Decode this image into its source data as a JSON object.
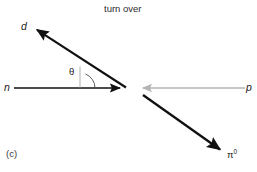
{
  "figure": {
    "title": "turn over",
    "part_label": "(c)",
    "background_color": "#ffffff"
  },
  "diagram": {
    "vertex": {
      "x": 126,
      "y": 88
    },
    "angle_marker": {
      "symbol": "θ",
      "name": "theta",
      "color": "#1a1a1a"
    },
    "arrows": [
      {
        "name": "deuteron-arrow",
        "label": "d",
        "italic": true,
        "color": "#111111",
        "from": {
          "x": 126,
          "y": 88
        },
        "to": {
          "x": 33,
          "y": 27
        },
        "width": 2.1,
        "head": "filled"
      },
      {
        "name": "neutron-arrow",
        "label": "n",
        "italic": true,
        "color": "#111111",
        "from": {
          "x": 14,
          "y": 88
        },
        "to": {
          "x": 126,
          "y": 88
        },
        "width": 1.7,
        "head": "filled"
      },
      {
        "name": "proton-arrow",
        "label": "p",
        "italic": true,
        "color": "#b4b4b4",
        "from": {
          "x": 245,
          "y": 88
        },
        "to": {
          "x": 137,
          "y": 88
        },
        "width": 1.5,
        "head": "filled"
      },
      {
        "name": "pion-arrow",
        "label": "π",
        "superscript": "0",
        "italic": false,
        "color": "#111111",
        "from": {
          "x": 143,
          "y": 95
        },
        "to": {
          "x": 225,
          "y": 153
        },
        "width": 2.3,
        "head": "filled"
      }
    ],
    "labels": {
      "d": "d",
      "n": "n",
      "p": "p",
      "pi": "π",
      "pi_superscript": "0",
      "theta": "θ"
    }
  }
}
